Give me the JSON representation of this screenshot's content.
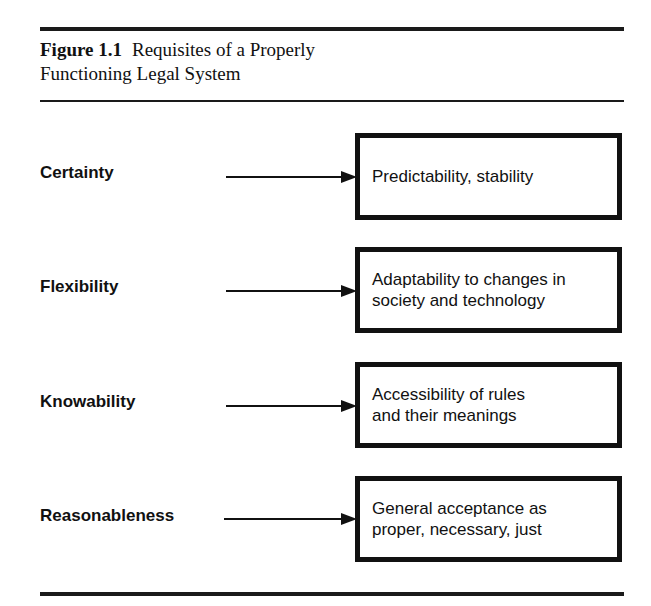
{
  "figure": {
    "number": "Figure 1.1",
    "title_line1": "Requisites of a Properly",
    "title_line2": "Functioning Legal System"
  },
  "rows": [
    {
      "requisite": "Certainty",
      "description": "Predictability, stability"
    },
    {
      "requisite": "Flexibility",
      "description": "Adaptability to changes in\nsociety and technology"
    },
    {
      "requisite": "Knowability",
      "description": "Accessibility of rules\nand their meanings"
    },
    {
      "requisite": "Reasonableness",
      "description": "General acceptance as\nproper, necessary, just"
    }
  ],
  "colors": {
    "ink": "#111111",
    "background": "#ffffff"
  }
}
